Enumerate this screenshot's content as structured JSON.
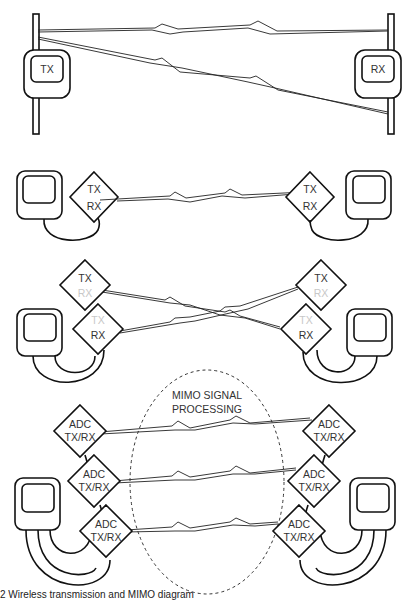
{
  "diagram": {
    "panel1": {
      "left_label": "TX",
      "right_label": "RX",
      "description": "Point-to-point wireless link with direct and reflected paths between TX and RX antennas"
    },
    "panel2": {
      "left_node": {
        "tx": "TX",
        "rx": "RX"
      },
      "right_node": {
        "tx": "TX",
        "rx": "RX"
      },
      "description": "Single TX/RX transceiver per device, one wireless link"
    },
    "panel3": {
      "left_top": {
        "tx": "TX",
        "rx": "RX"
      },
      "left_bottom": {
        "tx": "TX",
        "rx": "RX"
      },
      "right_top": {
        "tx": "TX",
        "rx": "RX"
      },
      "right_bottom": {
        "tx": "TX",
        "rx": "RX"
      },
      "description": "Separate transmitter and receiver diamonds per device, crossing links"
    },
    "panel4": {
      "cloud_label_line1": "MIMO SIGNAL",
      "cloud_label_line2": "PROCESSING",
      "left_nodes": [
        {
          "line1": "ADC",
          "line2": "TX/RX"
        },
        {
          "line1": "ADC",
          "line2": "TX/RX"
        },
        {
          "line1": "ADC",
          "line2": "TX/RX"
        }
      ],
      "right_nodes": [
        {
          "line1": "ADC",
          "line2": "TX/RX"
        },
        {
          "line1": "ADC",
          "line2": "TX/RX"
        },
        {
          "line1": "ADC",
          "line2": "TX/RX"
        }
      ]
    },
    "caption": "2 Wireless transmission and MIMO diagram"
  },
  "colors": {
    "line": "#111111",
    "text": "#333333",
    "faded_text": "#c8c8c8",
    "background": "#ffffff"
  }
}
